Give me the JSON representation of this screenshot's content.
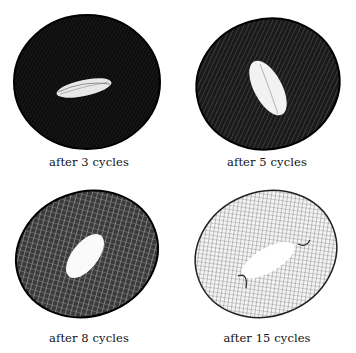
{
  "figure": {
    "panels": [
      {
        "caption": "after 3 cycles",
        "density": "very-dense",
        "hole_orientation": "horizontal"
      },
      {
        "caption": "after 5 cycles",
        "density": "dense",
        "hole_orientation": "vertical-tilted"
      },
      {
        "caption": "after 8 cycles",
        "density": "medium",
        "hole_orientation": "diagonal"
      },
      {
        "caption": "after 15 cycles",
        "density": "mesh",
        "hole_orientation": "diagonal-flat"
      }
    ],
    "colors": {
      "ink": "#111111",
      "background": "#ffffff"
    }
  }
}
